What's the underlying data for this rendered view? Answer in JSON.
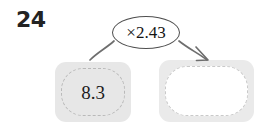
{
  "page": {
    "background_color": "#ffffff",
    "width": 271,
    "height": 129
  },
  "problem": {
    "number": "24",
    "type": "function-machine-multiplication"
  },
  "operation": {
    "label": "×2.43",
    "symbol": "×",
    "factor": "2.43",
    "bubble_border_color": "#4f4f4f",
    "bubble_fill_color": "#ffffff"
  },
  "boxes": {
    "input": {
      "value": "8.3",
      "empty": false,
      "fill_color": "#e7e7e7",
      "dash_color": "#b9b9b9"
    },
    "output": {
      "value": "",
      "empty": true,
      "fill_color": "#eaeaea",
      "inner_fill_color": "#ffffff",
      "dash_color": "#c9c9c9"
    }
  },
  "connectors": {
    "input_curve": {
      "has_arrowhead": false,
      "stroke_color": "#6e6e6e"
    },
    "output_arrow": {
      "has_arrowhead": true,
      "stroke_color": "#6e6e6e"
    }
  }
}
